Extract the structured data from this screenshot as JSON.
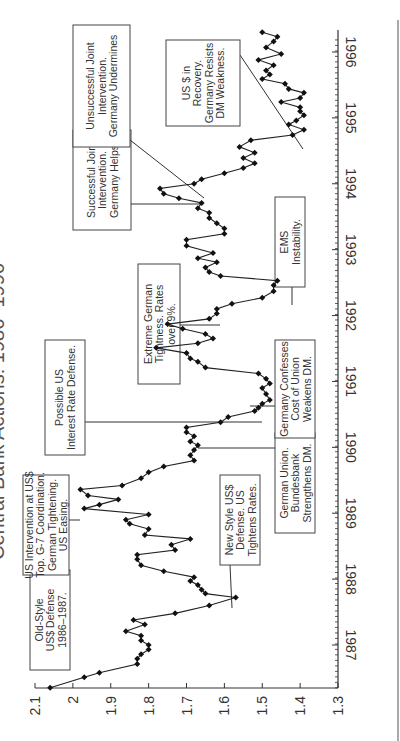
{
  "chart_data": {
    "type": "line",
    "title": "Central Bank Actions: 1986–1996",
    "orientation": "rotated-90-ccw",
    "xlabel": "",
    "ylabel": "",
    "ylim": [
      1.3,
      2.1
    ],
    "y_ticks": [
      "2.1",
      "2",
      "1.9",
      "1.8",
      "1.7",
      "1.6",
      "1.5",
      "1.4",
      "1.3"
    ],
    "x_ticks": [
      "1987",
      "1988",
      "1989",
      "1990",
      "1991",
      "1992",
      "1993",
      "1994",
      "1995",
      "1996"
    ],
    "grid": false,
    "legend": null,
    "series": [
      {
        "name": "DM per US$",
        "marker": "diamond",
        "x": [
          1986.35,
          1986.51,
          1986.58,
          1986.71,
          1986.79,
          1986.86,
          1986.93,
          1987.0,
          1987.07,
          1987.14,
          1987.21,
          1987.31,
          1987.38,
          1987.48,
          1987.6,
          1987.72,
          1987.78,
          1987.84,
          1987.91,
          1987.97,
          1988.03,
          1988.12,
          1988.21,
          1988.3,
          1988.37,
          1988.44,
          1988.52,
          1988.61,
          1988.67,
          1988.76,
          1988.84,
          1988.9,
          1988.98,
          1989.07,
          1989.13,
          1989.21,
          1989.27,
          1989.36,
          1989.42,
          1989.53,
          1989.62,
          1989.71,
          1989.8,
          1989.88,
          1989.96,
          1990.03,
          1990.09,
          1990.17,
          1990.23,
          1990.3,
          1990.38,
          1990.46,
          1990.55,
          1990.6,
          1990.66,
          1990.72,
          1990.81,
          1990.9,
          1990.97,
          1991.04,
          1991.12,
          1991.21,
          1991.3,
          1991.35,
          1991.43,
          1991.51,
          1991.58,
          1991.65,
          1991.72,
          1991.8,
          1991.87,
          1991.95,
          1992.03,
          1992.1,
          1992.18,
          1992.27,
          1992.37,
          1992.46,
          1992.53,
          1992.6,
          1992.66,
          1992.73,
          1992.81,
          1992.87,
          1992.95,
          1993.06,
          1993.15,
          1993.24,
          1993.32,
          1993.4,
          1993.48,
          1993.56,
          1993.63,
          1993.71,
          1993.78,
          1993.85,
          1993.93,
          1994.0,
          1994.07,
          1994.16,
          1994.24,
          1994.31,
          1994.39,
          1994.47,
          1994.56,
          1994.66,
          1994.74,
          1994.82,
          1994.9,
          1994.96,
          1995.04,
          1995.1,
          1995.16,
          1995.24,
          1995.3,
          1995.38,
          1995.44,
          1995.52,
          1995.59,
          1995.66,
          1995.72,
          1995.8,
          1995.88,
          1995.97,
          1996.07,
          1996.16,
          1996.23,
          1996.3
        ],
        "values": [
          2.06,
          1.97,
          1.93,
          1.83,
          1.83,
          1.82,
          1.8,
          1.8,
          1.82,
          1.82,
          1.86,
          1.81,
          1.84,
          1.73,
          1.64,
          1.57,
          1.65,
          1.66,
          1.67,
          1.69,
          1.68,
          1.76,
          1.82,
          1.83,
          1.83,
          1.73,
          1.74,
          1.69,
          1.81,
          1.8,
          1.85,
          1.86,
          1.8,
          1.97,
          1.93,
          1.88,
          1.96,
          1.98,
          1.87,
          1.82,
          1.8,
          1.76,
          1.68,
          1.69,
          1.68,
          1.67,
          1.69,
          1.68,
          1.7,
          1.7,
          1.61,
          1.59,
          1.52,
          1.51,
          1.5,
          1.48,
          1.49,
          1.5,
          1.48,
          1.49,
          1.51,
          1.65,
          1.67,
          1.69,
          1.7,
          1.78,
          1.67,
          1.63,
          1.65,
          1.71,
          1.75,
          1.64,
          1.62,
          1.62,
          1.58,
          1.5,
          1.47,
          1.47,
          1.46,
          1.61,
          1.64,
          1.65,
          1.62,
          1.67,
          1.63,
          1.7,
          1.7,
          1.6,
          1.6,
          1.62,
          1.64,
          1.64,
          1.67,
          1.66,
          1.72,
          1.76,
          1.77,
          1.68,
          1.66,
          1.6,
          1.55,
          1.52,
          1.55,
          1.52,
          1.56,
          1.53,
          1.42,
          1.39,
          1.43,
          1.41,
          1.39,
          1.4,
          1.4,
          1.45,
          1.4,
          1.39,
          1.43,
          1.44,
          1.5,
          1.48,
          1.49,
          1.47,
          1.51,
          1.45,
          1.49,
          1.47,
          1.46,
          1.5
        ]
      }
    ],
    "annotations": [
      {
        "text": [
          "Old-Style",
          "US$ Defense",
          "1986–1987."
        ],
        "box_y_value": 1.98,
        "x_time": 1986.5
      },
      {
        "text": [
          "New Style US$",
          "Defense. US",
          "Tightens Rates."
        ],
        "box_y_value": 1.58,
        "x_time": 1987.7
      },
      {
        "text": [
          "US Intervention at US$",
          "Top. G-7 Coordination.",
          "German Tightening.",
          "US Easing."
        ],
        "box_y_value": 2.0,
        "x_time": 1989.2
      },
      {
        "text": [
          "German Union.",
          "Bundesbank",
          "Strengthens DM."
        ],
        "box_y_value": 1.47,
        "x_time": 1990.0
      },
      {
        "text": [
          "Possible US",
          "Interest Rate Defense."
        ],
        "box_y_value": 1.95,
        "x_time": 1990.6
      },
      {
        "text": [
          "Germany Confesses",
          "Cost of Union",
          "Weakens DM."
        ],
        "box_y_value": 1.47,
        "x_time": 1991.0
      },
      {
        "text": [
          "Extreme German",
          "Tightness. Rates",
          "over 9%."
        ],
        "box_y_value": 1.73,
        "x_time": 1992.1
      },
      {
        "text": [
          "EMS",
          "Instability."
        ],
        "box_y_value": 1.5,
        "x_time": 1992.7
      },
      {
        "text": [
          "Successful Joint",
          "Intervention.",
          "Germany Helps."
        ],
        "box_y_value": 1.86,
        "x_time": 1993.9
      },
      {
        "text": [
          "Unsuccessful Joint",
          "Intervention.",
          "Germany Undermines"
        ],
        "box_y_value": 1.86,
        "x_time": 1995.5
      },
      {
        "text": [
          "US $ in",
          "Recovery.",
          "Germany Resists",
          "DM Weakness."
        ],
        "box_y_value": 1.62,
        "x_time": 1995.6
      }
    ]
  }
}
